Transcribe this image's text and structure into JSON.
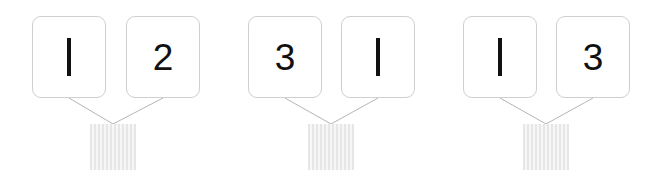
{
  "diagram": {
    "type": "number-bond-set",
    "background_color": "#ffffff",
    "card_border_color": "#cfcfcf",
    "card_fill_color": "#ffffff",
    "digit_color": "#111111",
    "connector_color": "#b5b5b5",
    "result_box_fill": "#f2f2f2",
    "result_box_stripe": "#e6e6e6",
    "groups": [
      {
        "id": "group-1",
        "cards": [
          {
            "value": "1",
            "x": 32,
            "y": 16
          },
          {
            "value": "2",
            "x": 126,
            "y": 16
          }
        ],
        "result": {
          "value": "",
          "x": 90,
          "y": 124
        },
        "connectors": [
          {
            "x1": 69,
            "y1": 98,
            "x2": 113,
            "y2": 124
          },
          {
            "x1": 163,
            "y1": 98,
            "x2": 113,
            "y2": 124
          }
        ]
      },
      {
        "id": "group-2",
        "cards": [
          {
            "value": "3",
            "x": 248,
            "y": 16
          },
          {
            "value": "1",
            "x": 341,
            "y": 16
          }
        ],
        "result": {
          "value": "",
          "x": 308,
          "y": 124
        },
        "connectors": [
          {
            "x1": 285,
            "y1": 98,
            "x2": 331,
            "y2": 124
          },
          {
            "x1": 378,
            "y1": 98,
            "x2": 331,
            "y2": 124
          }
        ]
      },
      {
        "id": "group-3",
        "cards": [
          {
            "value": "1",
            "x": 463,
            "y": 16
          },
          {
            "value": "3",
            "x": 556,
            "y": 16
          }
        ],
        "result": {
          "value": "",
          "x": 523,
          "y": 124
        },
        "connectors": [
          {
            "x1": 500,
            "y1": 98,
            "x2": 546,
            "y2": 124
          },
          {
            "x1": 593,
            "y1": 98,
            "x2": 546,
            "y2": 124
          }
        ]
      }
    ]
  }
}
